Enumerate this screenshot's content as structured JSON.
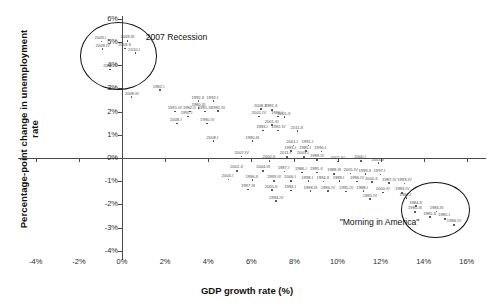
{
  "chart_data": {
    "type": "scatter",
    "title": "",
    "xlabel": "GDP growth rate (%)",
    "ylabel": "Percentage-point change in unemployment rate",
    "xlim": [
      -4,
      16
    ],
    "ylim": [
      -4,
      6
    ],
    "xticks": [
      "-4%",
      "-2%",
      "0%",
      "2%",
      "4%",
      "6%",
      "8%",
      "10%",
      "12%",
      "14%",
      "16%"
    ],
    "yticks": [
      "6%",
      "5%",
      "4%",
      "3%",
      "2%",
      "1%",
      "0%",
      "-1%",
      "-2%",
      "-3%",
      "-4%"
    ],
    "grid": false,
    "legend": "none",
    "annotations": [
      {
        "text": "2007 Recession",
        "x": 1.1,
        "y": 5.2
      },
      {
        "text": "\"Morning in America\"",
        "x": 10.1,
        "y": -2.75
      }
    ],
    "highlight_circles": [
      {
        "label": "2007 Recession cluster",
        "cx": -0.2,
        "cy": 4.45,
        "rx": 1.75,
        "ry": 1.42
      },
      {
        "label": "Morning in America cluster",
        "cx": 14.5,
        "cy": -2.2,
        "rx": 1.55,
        "ry": 1.15
      }
    ],
    "points": [
      {
        "label": "2009-III",
        "x": 0.25,
        "y": 5.05
      },
      {
        "label": "2009-I",
        "x": -0.95,
        "y": 5.02
      },
      {
        "label": "2009-II",
        "x": 0.15,
        "y": 4.72
      },
      {
        "label": "2009-IV",
        "x": -0.9,
        "y": 4.7
      },
      {
        "label": "2010-I",
        "x": 0.62,
        "y": 4.52
      },
      {
        "label": "2008-IV",
        "x": -0.55,
        "y": 3.82
      },
      {
        "label": "2008-III",
        "x": 0.45,
        "y": 2.62
      },
      {
        "label": "1982-I",
        "x": 1.75,
        "y": 2.92
      },
      {
        "label": "1992-II",
        "x": 3.55,
        "y": 2.45
      },
      {
        "label": "1992-I",
        "x": 4.25,
        "y": 2.45
      },
      {
        "label": "1980-III",
        "x": 3.55,
        "y": 2.15
      },
      {
        "label": "1991-III",
        "x": 2.45,
        "y": 2.0
      },
      {
        "label": "1982-II",
        "x": 3.15,
        "y": 2.0
      },
      {
        "label": "1991-IV",
        "x": 3.85,
        "y": 2.0
      },
      {
        "label": "1992-III",
        "x": 4.45,
        "y": 2.02
      },
      {
        "label": "1991-I",
        "x": 3.05,
        "y": 1.78
      },
      {
        "label": "2008-II",
        "x": 6.45,
        "y": 2.1
      },
      {
        "label": "1981-II",
        "x": 6.95,
        "y": 2.08
      },
      {
        "label": "2001-IV",
        "x": 6.35,
        "y": 1.78
      },
      {
        "label": "1980-I",
        "x": 7.25,
        "y": 1.78
      },
      {
        "label": "2001-II",
        "x": 7.55,
        "y": 1.76
      },
      {
        "label": "2008-I",
        "x": 2.55,
        "y": 1.48
      },
      {
        "label": "1990-IV",
        "x": 3.95,
        "y": 1.48
      },
      {
        "label": "2001-III",
        "x": 6.95,
        "y": 1.42
      },
      {
        "label": "1983-I",
        "x": 6.55,
        "y": 1.18
      },
      {
        "label": "1992-IV",
        "x": 7.25,
        "y": 1.18
      },
      {
        "label": "2011-II",
        "x": 8.15,
        "y": 1.16
      },
      {
        "label": "2008-I",
        "x": 4.25,
        "y": 0.72
      },
      {
        "label": "1990-III",
        "x": 6.05,
        "y": 0.72
      },
      {
        "label": "2001-I",
        "x": 7.95,
        "y": 0.54
      },
      {
        "label": "1991-I",
        "x": 8.65,
        "y": 0.54
      },
      {
        "label": "1993-I",
        "x": 7.85,
        "y": 0.3
      },
      {
        "label": "1985-I",
        "x": 8.55,
        "y": 0.3
      },
      {
        "label": "1990-I",
        "x": 9.25,
        "y": 0.28
      },
      {
        "label": "2007-IV",
        "x": 5.55,
        "y": 0.06
      },
      {
        "label": "2002-II",
        "x": 6.85,
        "y": -0.12
      },
      {
        "label": "2011-I",
        "x": 7.65,
        "y": 0.05
      },
      {
        "label": "2003-I",
        "x": 8.45,
        "y": 0.05
      },
      {
        "label": "1989-IV",
        "x": 9.05,
        "y": -0.08
      },
      {
        "label": "2002-IV",
        "x": 10.0,
        "y": -0.15
      },
      {
        "label": "2000-I",
        "x": 11.1,
        "y": -0.12
      },
      {
        "label": "2003-II",
        "x": 11.9,
        "y": -0.22
      },
      {
        "label": "2001-II",
        "x": 5.35,
        "y": -0.55
      },
      {
        "label": "2004-III",
        "x": 6.55,
        "y": -0.55
      },
      {
        "label": "1987-I",
        "x": 7.55,
        "y": -0.58
      },
      {
        "label": "1986-I",
        "x": 8.35,
        "y": -0.62
      },
      {
        "label": "1995-II",
        "x": 9.05,
        "y": -0.62
      },
      {
        "label": "1988-III",
        "x": 9.85,
        "y": -0.68
      },
      {
        "label": "2005-IV",
        "x": 10.6,
        "y": -0.66
      },
      {
        "label": "1999-II",
        "x": 11.3,
        "y": -0.7
      },
      {
        "label": "1997-I",
        "x": 12.0,
        "y": -0.72
      },
      {
        "label": "2004-I",
        "x": 4.95,
        "y": -0.92
      },
      {
        "label": "1996-II",
        "x": 6.05,
        "y": -0.95
      },
      {
        "label": "1993-IV",
        "x": 7.05,
        "y": -0.98
      },
      {
        "label": "2006-I",
        "x": 7.85,
        "y": -0.98
      },
      {
        "label": "1998-I",
        "x": 8.65,
        "y": -1.0
      },
      {
        "label": "1994-II",
        "x": 9.35,
        "y": -1.02
      },
      {
        "label": "1989-I",
        "x": 10.1,
        "y": -1.0
      },
      {
        "label": "1996-IV",
        "x": 10.9,
        "y": -1.02
      },
      {
        "label": "2000-II",
        "x": 11.6,
        "y": -1.04
      },
      {
        "label": "1987-IV",
        "x": 12.4,
        "y": -1.08
      },
      {
        "label": "1999-IV",
        "x": 13.1,
        "y": -1.1
      },
      {
        "label": "1997-III",
        "x": 5.85,
        "y": -1.35
      },
      {
        "label": "2005-II",
        "x": 6.95,
        "y": -1.38
      },
      {
        "label": "1994-I",
        "x": 7.85,
        "y": -1.4
      },
      {
        "label": "1998-III",
        "x": 8.75,
        "y": -1.42
      },
      {
        "label": "1986-IV",
        "x": 9.55,
        "y": -1.42
      },
      {
        "label": "1995-IV",
        "x": 10.4,
        "y": -1.45
      },
      {
        "label": "1988-I",
        "x": 11.2,
        "y": -1.42
      },
      {
        "label": "2000-IV",
        "x": 12.1,
        "y": -1.48
      },
      {
        "label": "1983-IV",
        "x": 13.0,
        "y": -1.5
      },
      {
        "label": "1985-IV",
        "x": 11.5,
        "y": -1.78
      },
      {
        "label": "1994-IV",
        "x": 7.15,
        "y": -1.85
      },
      {
        "label": "1984-I",
        "x": 13.2,
        "y": -1.72
      },
      {
        "label": "1984-II",
        "x": 13.65,
        "y": -2.08
      },
      {
        "label": "1985-III",
        "x": 13.6,
        "y": -2.32
      },
      {
        "label": "1984-III",
        "x": 14.6,
        "y": -2.3
      },
      {
        "label": "1985-II",
        "x": 14.3,
        "y": -2.55
      },
      {
        "label": "1985-I",
        "x": 15.0,
        "y": -2.62
      },
      {
        "label": "1984-IV",
        "x": 15.4,
        "y": -2.88
      }
    ]
  }
}
